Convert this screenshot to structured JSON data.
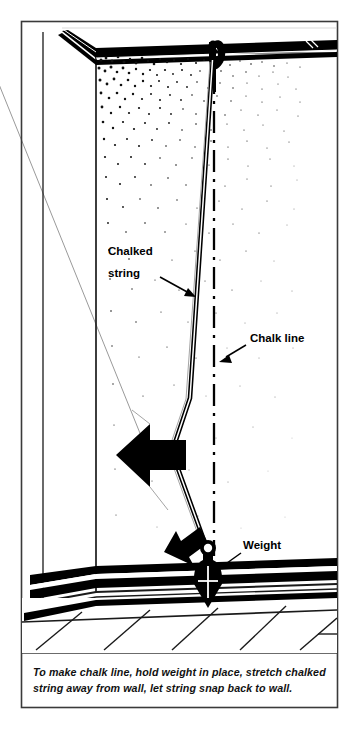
{
  "labels": {
    "chalked_string_line1": "Chalked",
    "chalked_string_line2": "string",
    "chalk_line": "Chalk line",
    "weight": "Weight"
  },
  "caption": {
    "line1": "To make chalk line, hold weight in place, stretch chalked",
    "line2": "string away from wall, let string snap back to wall."
  },
  "colors": {
    "ink": "#000000",
    "paper": "#ffffff",
    "frame": "#3a3a3a",
    "stray_line": "#8d8d8d",
    "thin_rule": "#2b2b2b"
  },
  "scene": {
    "elements": [
      "ceiling-crown-molding",
      "wall-corner",
      "chalk-dust-stipple",
      "nail-hook",
      "chalked-string",
      "chalk-line-dash-dot",
      "plumb-bob-weight",
      "snap-arrow-large",
      "snap-arrow-small",
      "baseboard",
      "floorboards"
    ]
  }
}
